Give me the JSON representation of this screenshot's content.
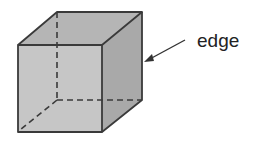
{
  "diagram": {
    "type": "cube",
    "label": "edge",
    "colors": {
      "outline": "#3a3a3a",
      "front_face": "#c4c4c4",
      "top_face": "#b3b3b3",
      "right_face": "#a8a8a8",
      "hidden_edge": "#3a3a3a",
      "arrow": "#333333",
      "label": "#222222"
    }
  }
}
